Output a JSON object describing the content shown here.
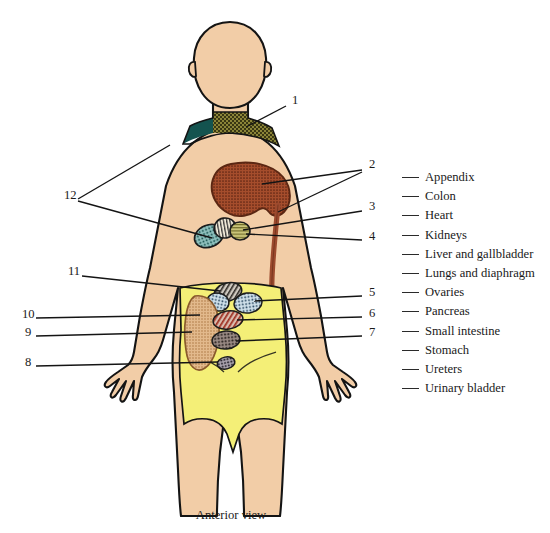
{
  "diagram": {
    "caption": "Anterior view",
    "colors": {
      "skin": "#f2cda7",
      "abdomen_yellow": "#f4ef77",
      "liver_brown": "#a0472a",
      "colon_tube": "#9c4a2e",
      "neck_teal": "#14534f",
      "neck_olive": "#6f6a2a",
      "outline": "#141414",
      "leader_line": "#141414"
    },
    "number_labels": [
      {
        "id": "1",
        "x": 292,
        "y": 104
      },
      {
        "id": "2",
        "x": 369,
        "y": 168
      },
      {
        "id": "3",
        "x": 369,
        "y": 210
      },
      {
        "id": "4",
        "x": 369,
        "y": 240
      },
      {
        "id": "5",
        "x": 369,
        "y": 296
      },
      {
        "id": "6",
        "x": 369,
        "y": 317
      },
      {
        "id": "7",
        "x": 369,
        "y": 336
      },
      {
        "id": "8",
        "x": 25,
        "y": 366
      },
      {
        "id": "9",
        "x": 25,
        "y": 336
      },
      {
        "id": "10",
        "x": 22,
        "y": 318
      },
      {
        "id": "11",
        "x": 68,
        "y": 275
      },
      {
        "id": "12",
        "x": 64,
        "y": 199
      }
    ],
    "legend": {
      "items": [
        {
          "label": "Appendix"
        },
        {
          "label": "Colon"
        },
        {
          "label": "Heart"
        },
        {
          "label": "Kidneys"
        },
        {
          "label": "Liver and gallbladder"
        },
        {
          "label": "Lungs and diaphragm"
        },
        {
          "label": "Ovaries"
        },
        {
          "label": "Pancreas"
        },
        {
          "label": "Small intestine"
        },
        {
          "label": "Stomach"
        },
        {
          "label": "Ureters"
        },
        {
          "label": "Urinary bladder"
        }
      ]
    }
  }
}
